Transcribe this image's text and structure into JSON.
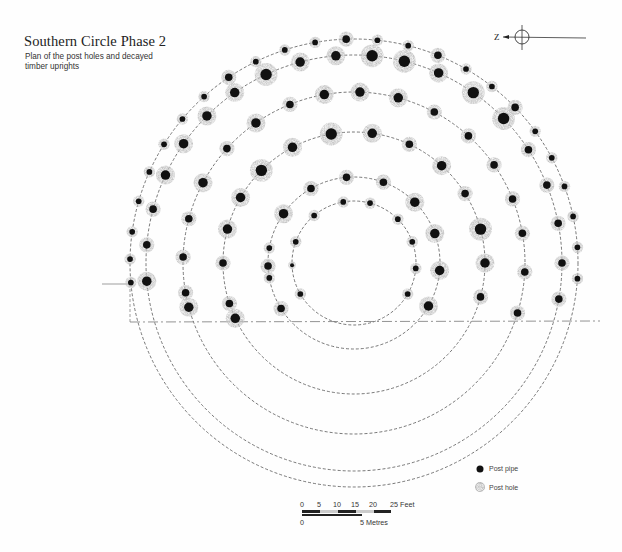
{
  "title": "Southern Circle Phase 2",
  "subtitle_line1": "Plan of the post holes and decayed",
  "subtitle_line2": "timber uprights",
  "north_arrow": {
    "label": "Z",
    "icon": "north-arrow-icon",
    "cx": 522,
    "cy": 37
  },
  "legend": {
    "items": [
      {
        "label": "Post pipe",
        "icon": "post-pipe-icon"
      },
      {
        "label": "Post hole",
        "icon": "post-hole-icon"
      }
    ]
  },
  "scale_bar": {
    "feet_ticks": [
      "0",
      "5",
      "10",
      "15",
      "20",
      "25 Feet"
    ],
    "metres_ticks": [
      "0",
      "5 Metres"
    ]
  },
  "colors": {
    "ink": "#111111",
    "hole": "#b9b9b9",
    "ring": "#555555"
  },
  "center": {
    "x": 354,
    "y": 263
  },
  "cut_line_y": 322,
  "rings": [
    {
      "r": 62,
      "posts": [
        [
          -100,
          3
        ],
        [
          -75,
          3
        ],
        [
          -45,
          3
        ],
        [
          -20,
          3
        ],
        [
          -160,
          3
        ],
        [
          -130,
          3
        ],
        [
          5,
          3
        ],
        [
          30,
          3
        ],
        [
          150,
          3
        ],
        [
          178,
          2
        ]
      ]
    },
    {
      "r": 86,
      "posts": [
        [
          -95,
          4
        ],
        [
          -70,
          4
        ],
        [
          -45,
          5
        ],
        [
          -20,
          5
        ],
        [
          5,
          5
        ],
        [
          30,
          5
        ],
        [
          -120,
          4
        ],
        [
          -145,
          5
        ],
        [
          -170,
          3
        ],
        [
          170,
          3
        ],
        [
          148,
          4
        ],
        [
          178,
          4
        ]
      ]
    },
    {
      "r": 131,
      "posts": [
        [
          -100,
          6
        ],
        [
          -82,
          5
        ],
        [
          -65,
          4
        ],
        [
          -48,
          5
        ],
        [
          -32,
          4
        ],
        [
          -15,
          6
        ],
        [
          0,
          5
        ],
        [
          15,
          4
        ],
        [
          30,
          6
        ],
        [
          -118,
          5
        ],
        [
          -135,
          6
        ],
        [
          -150,
          5
        ],
        [
          -165,
          5
        ],
        [
          -180,
          4
        ],
        [
          162,
          4
        ],
        [
          155,
          5
        ]
      ]
    },
    {
      "r": 171,
      "posts": [
        [
          -100,
          5
        ],
        [
          -88,
          5
        ],
        [
          -75,
          5
        ],
        [
          -62,
          4
        ],
        [
          -48,
          4
        ],
        [
          -35,
          4
        ],
        [
          -22,
          4
        ],
        [
          -10,
          4
        ],
        [
          3,
          4
        ],
        [
          17,
          4
        ],
        [
          -112,
          4
        ],
        [
          -125,
          5
        ],
        [
          -138,
          4
        ],
        [
          -152,
          5
        ],
        [
          -165,
          4
        ],
        [
          -178,
          4
        ],
        [
          170,
          4
        ],
        [
          165,
          5
        ]
      ]
    },
    {
      "r": 208,
      "posts": [
        [
          -95,
          5
        ],
        [
          -85,
          6
        ],
        [
          -76,
          6
        ],
        [
          -66,
          5
        ],
        [
          -55,
          6
        ],
        [
          -44,
          6
        ],
        [
          -33,
          4
        ],
        [
          -22,
          4
        ],
        [
          -11,
          4
        ],
        [
          0,
          4
        ],
        [
          10,
          4
        ],
        [
          -105,
          5
        ],
        [
          -115,
          6
        ],
        [
          -125,
          5
        ],
        [
          -135,
          5
        ],
        [
          -145,
          5
        ],
        [
          -155,
          5
        ],
        [
          -165,
          4
        ],
        [
          -175,
          4
        ],
        [
          175,
          5
        ]
      ]
    },
    {
      "r": 224,
      "posts": [
        [
          -92,
          4
        ],
        [
          -84,
          3
        ],
        [
          -76,
          3
        ],
        [
          -68,
          4
        ],
        [
          -60,
          3
        ],
        [
          -52,
          3
        ],
        [
          -44,
          4
        ],
        [
          -36,
          3
        ],
        [
          -28,
          3
        ],
        [
          -20,
          3
        ],
        [
          -12,
          3
        ],
        [
          -4,
          3
        ],
        [
          4,
          3
        ],
        [
          -100,
          3
        ],
        [
          -108,
          3
        ],
        [
          -116,
          3
        ],
        [
          -124,
          4
        ],
        [
          -132,
          3
        ],
        [
          -140,
          3
        ],
        [
          -148,
          3
        ],
        [
          -156,
          3
        ],
        [
          -164,
          3
        ],
        [
          -172,
          3
        ],
        [
          -179,
          3
        ],
        [
          175,
          3
        ]
      ]
    }
  ]
}
